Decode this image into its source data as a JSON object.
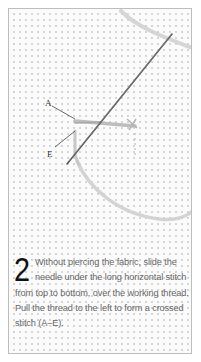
{
  "figure": {
    "labels": {
      "a": "A",
      "e": "E"
    }
  },
  "instruction": {
    "step_number": "2",
    "text": "Without piercing the fabric, slide the needle under the long horizontal stitch from top to bottom, over the working thread. Pull the thread to the left to form a crossed stitch (A–E)."
  },
  "colors": {
    "frame_border": "#bdbdbd",
    "fabric_background": "#fbfbfb",
    "fabric_dots": "#d6d6d6",
    "thread": "#c4c4c4",
    "needle": "#555555",
    "step_number": "#111111",
    "caption_text": "#666666"
  }
}
